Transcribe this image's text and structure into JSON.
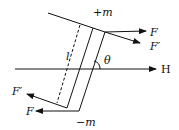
{
  "diagram": {
    "labels": {
      "plus_m": "+m",
      "minus_m": "−m",
      "force_top": "F",
      "force_top_prime": "F′",
      "force_bottom": "F",
      "force_bottom_prime": "F′",
      "length": "l",
      "angle": "θ",
      "field": "H"
    },
    "colors": {
      "line": "#111111",
      "background": "#ffffff"
    }
  }
}
